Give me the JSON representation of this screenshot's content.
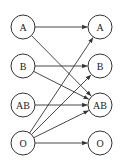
{
  "diagram": {
    "type": "bipartite-directed-graph",
    "style": {
      "stroke_color": "#333333",
      "fill_color": "#ffffff",
      "text_color": "#222222",
      "node_radius": 12
    },
    "left_nodes": [
      {
        "id": "L_A",
        "label": "A",
        "x": 23,
        "y": 27
      },
      {
        "id": "L_B",
        "label": "B",
        "x": 23,
        "y": 66
      },
      {
        "id": "L_AB",
        "label": "AB",
        "x": 23,
        "y": 105
      },
      {
        "id": "L_O",
        "label": "O",
        "x": 23,
        "y": 143
      }
    ],
    "right_nodes": [
      {
        "id": "R_A",
        "label": "A",
        "x": 100,
        "y": 27
      },
      {
        "id": "R_B",
        "label": "B",
        "x": 100,
        "y": 66
      },
      {
        "id": "R_AB",
        "label": "AB",
        "x": 100,
        "y": 105
      },
      {
        "id": "R_O",
        "label": "O",
        "x": 100,
        "y": 143
      }
    ],
    "edges": [
      {
        "from": "L_A",
        "to": "R_A"
      },
      {
        "from": "L_A",
        "to": "R_AB"
      },
      {
        "from": "L_B",
        "to": "R_B"
      },
      {
        "from": "L_B",
        "to": "R_AB"
      },
      {
        "from": "L_AB",
        "to": "R_AB"
      },
      {
        "from": "L_O",
        "to": "R_A"
      },
      {
        "from": "L_O",
        "to": "R_B"
      },
      {
        "from": "L_O",
        "to": "R_AB"
      },
      {
        "from": "L_O",
        "to": "R_O"
      }
    ]
  }
}
